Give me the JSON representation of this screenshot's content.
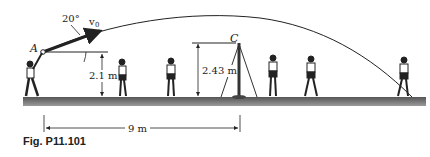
{
  "figure": {
    "caption": "Fig. P11.101",
    "labels": {
      "point_A": "A",
      "point_C": "C",
      "angle": "20°",
      "velocity": "v",
      "velocity_sub": "0",
      "release_height": "2.1 m",
      "net_height": "2.43 m",
      "horizontal_distance": "9 m"
    },
    "colors": {
      "ground": "#6e6e6e",
      "line": "#222222",
      "background": "#ffffff"
    }
  }
}
